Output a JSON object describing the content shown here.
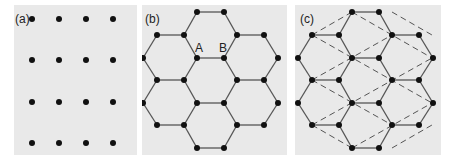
{
  "colors": {
    "panel_bg": "#e9e9e9",
    "atom": "#111111",
    "bond": "#555555",
    "dashed": "#555555"
  },
  "panels": [
    {
      "id": "a",
      "label": "(a)",
      "description": "square lattice of points",
      "rect": [
        14,
        5,
        123,
        150
      ],
      "label_pos": [
        15,
        23
      ],
      "atoms": [
        [
          32,
          19
        ],
        [
          59,
          19
        ],
        [
          86,
          19
        ],
        [
          113,
          19
        ],
        [
          32,
          60
        ],
        [
          59,
          60
        ],
        [
          86,
          60
        ],
        [
          113,
          60
        ],
        [
          32,
          102
        ],
        [
          59,
          102
        ],
        [
          86,
          102
        ],
        [
          113,
          102
        ],
        [
          32,
          143
        ],
        [
          59,
          143
        ],
        [
          86,
          143
        ],
        [
          113,
          143
        ]
      ]
    },
    {
      "id": "b",
      "label": "(b)",
      "description": "honeycomb lattice",
      "rect": [
        142,
        5,
        145,
        150
      ],
      "label_pos": [
        145,
        23
      ],
      "site_labels": [
        {
          "text": "A",
          "pos": [
            195,
            52
          ]
        },
        {
          "text": "B",
          "pos": [
            219,
            52
          ]
        }
      ],
      "dx": 0,
      "dashed": false
    },
    {
      "id": "c",
      "label": "(c)",
      "description": "honeycomb lattice with triangular sublattice (dashed)",
      "rect": [
        295,
        5,
        146,
        150
      ],
      "label_pos": [
        300,
        23
      ],
      "dx": 155,
      "dashed": true
    }
  ],
  "honeycomb": {
    "atoms": [
      [
        197,
        12
      ],
      [
        224,
        12
      ],
      [
        157,
        35
      ],
      [
        184,
        35
      ],
      [
        237,
        35
      ],
      [
        264,
        35
      ],
      [
        143,
        58
      ],
      [
        197,
        58
      ],
      [
        224,
        58
      ],
      [
        278,
        58
      ],
      [
        157,
        80
      ],
      [
        184,
        80
      ],
      [
        237,
        80
      ],
      [
        264,
        80
      ],
      [
        143,
        103
      ],
      [
        197,
        103
      ],
      [
        224,
        103
      ],
      [
        278,
        103
      ],
      [
        157,
        125
      ],
      [
        184,
        125
      ],
      [
        237,
        125
      ],
      [
        264,
        125
      ],
      [
        197,
        148
      ],
      [
        224,
        148
      ]
    ],
    "bonds": [
      [
        [
          197,
          12
        ],
        [
          224,
          12
        ]
      ],
      [
        [
          197,
          12
        ],
        [
          184,
          35
        ]
      ],
      [
        [
          224,
          12
        ],
        [
          237,
          35
        ]
      ],
      [
        [
          157,
          35
        ],
        [
          184,
          35
        ]
      ],
      [
        [
          237,
          35
        ],
        [
          264,
          35
        ]
      ],
      [
        [
          157,
          35
        ],
        [
          143,
          58
        ]
      ],
      [
        [
          184,
          35
        ],
        [
          197,
          58
        ]
      ],
      [
        [
          237,
          35
        ],
        [
          224,
          58
        ]
      ],
      [
        [
          264,
          35
        ],
        [
          278,
          58
        ]
      ],
      [
        [
          197,
          58
        ],
        [
          224,
          58
        ]
      ],
      [
        [
          143,
          58
        ],
        [
          157,
          80
        ]
      ],
      [
        [
          197,
          58
        ],
        [
          184,
          80
        ]
      ],
      [
        [
          224,
          58
        ],
        [
          237,
          80
        ]
      ],
      [
        [
          278,
          58
        ],
        [
          264,
          80
        ]
      ],
      [
        [
          157,
          80
        ],
        [
          184,
          80
        ]
      ],
      [
        [
          237,
          80
        ],
        [
          264,
          80
        ]
      ],
      [
        [
          157,
          80
        ],
        [
          143,
          103
        ]
      ],
      [
        [
          184,
          80
        ],
        [
          197,
          103
        ]
      ],
      [
        [
          237,
          80
        ],
        [
          224,
          103
        ]
      ],
      [
        [
          264,
          80
        ],
        [
          278,
          103
        ]
      ],
      [
        [
          197,
          103
        ],
        [
          224,
          103
        ]
      ],
      [
        [
          143,
          103
        ],
        [
          157,
          125
        ]
      ],
      [
        [
          197,
          103
        ],
        [
          184,
          125
        ]
      ],
      [
        [
          224,
          103
        ],
        [
          237,
          125
        ]
      ],
      [
        [
          278,
          103
        ],
        [
          264,
          125
        ]
      ],
      [
        [
          157,
          125
        ],
        [
          184,
          125
        ]
      ],
      [
        [
          237,
          125
        ],
        [
          264,
          125
        ]
      ],
      [
        [
          184,
          125
        ],
        [
          197,
          148
        ]
      ],
      [
        [
          237,
          125
        ],
        [
          224,
          148
        ]
      ],
      [
        [
          197,
          148
        ],
        [
          224,
          148
        ]
      ]
    ],
    "dashed_lines": [
      [
        [
          157,
          35
        ],
        [
          197,
          12
        ]
      ],
      [
        [
          157,
          80
        ],
        [
          237,
          35
        ]
      ],
      [
        [
          157,
          125
        ],
        [
          277,
          58
        ]
      ],
      [
        [
          197,
          148
        ],
        [
          277,
          103
        ]
      ],
      [
        [
          237,
          148
        ],
        [
          277,
          125
        ]
      ],
      [
        [
          197,
          12
        ],
        [
          277,
          58
        ]
      ],
      [
        [
          157,
          35
        ],
        [
          277,
          103
        ]
      ],
      [
        [
          157,
          80
        ],
        [
          237,
          125
        ]
      ],
      [
        [
          157,
          125
        ],
        [
          197,
          148
        ]
      ],
      [
        [
          237,
          12
        ],
        [
          277,
          35
        ]
      ]
    ]
  }
}
